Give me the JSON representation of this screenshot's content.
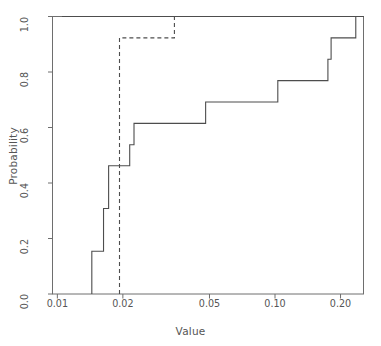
{
  "chart_data": {
    "type": "line",
    "title": "",
    "xlabel": "Value",
    "ylabel": "Probability",
    "xscale": "log",
    "yscale": "linear",
    "xlim": [
      0.0095,
      0.255
    ],
    "ylim": [
      0.0,
      1.0
    ],
    "grid": false,
    "legend": "none",
    "x_ticks": [
      {
        "value": 0.01,
        "label": "0.01"
      },
      {
        "value": 0.02,
        "label": "0.02"
      },
      {
        "value": 0.05,
        "label": "0.05"
      },
      {
        "value": 0.1,
        "label": "0.10"
      },
      {
        "value": 0.2,
        "label": "0.20"
      }
    ],
    "y_ticks": [
      {
        "value": 0.0,
        "label": "0.0"
      },
      {
        "value": 0.2,
        "label": "0.2"
      },
      {
        "value": 0.4,
        "label": "0.4"
      },
      {
        "value": 0.6,
        "label": "0.6"
      },
      {
        "value": 0.8,
        "label": "0.8"
      },
      {
        "value": 1.0,
        "label": "1.0"
      }
    ],
    "series": [
      {
        "name": "empirical-cdf",
        "style": "solid",
        "color": "#4d4d4d",
        "width": 1.1,
        "step": "post",
        "x": [
          0.0144,
          0.0144,
          0.0163,
          0.0172,
          0.0215,
          0.0225,
          0.048,
          0.103,
          0.175,
          0.181,
          0.235,
          0.255
        ],
        "y": [
          0.0,
          0.154,
          0.308,
          0.462,
          0.538,
          0.615,
          0.692,
          0.769,
          0.846,
          0.923,
          1.0,
          1.0
        ]
      },
      {
        "name": "upper-plateau",
        "style": "solid",
        "color": "#4d4d4d",
        "width": 1.1,
        "step": "post",
        "x": [
          0.0105,
          0.255
        ],
        "y": [
          1.0,
          1.0
        ]
      },
      {
        "name": "fitted-cdf-dashed",
        "style": "dashed",
        "color": "#4d4d4d",
        "width": 1.1,
        "step": "post",
        "x": [
          0.0193,
          0.0193,
          0.0345,
          0.0345
        ],
        "y": [
          0.0,
          0.923,
          0.923,
          1.0
        ]
      }
    ]
  }
}
